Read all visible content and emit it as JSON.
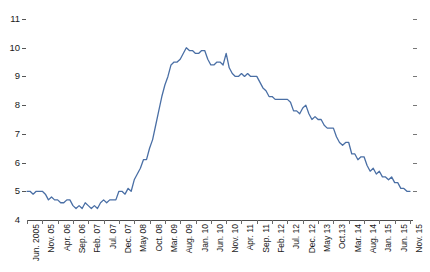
{
  "chart_data": {
    "type": "line",
    "title": "",
    "subtitle": "",
    "xlabel": "",
    "ylabel": "",
    "grid": false,
    "legend": "none",
    "line_color": "#4a6fa5",
    "axis_color": "#4a4a4a",
    "ylim": [
      4,
      11
    ],
    "yticks": [
      4,
      5,
      6,
      7,
      8,
      9,
      10,
      11
    ],
    "ytick_labels": [
      "4",
      "5",
      "6",
      "7",
      "8",
      "9",
      "10",
      "11"
    ],
    "xtick_labels": [
      "Jun. 2005",
      "Nov. 05",
      "Apr. 06",
      "Sep. 06",
      "Feb. 07",
      "Jul. 07",
      "Dec. 07",
      "May 08",
      "Oct. 08",
      "Mar. 09",
      "Aug. 09",
      "Jan. 10",
      "Jun. 10",
      "Nov. 10",
      "Apr. 11",
      "Sep. 11",
      "Feb. 12",
      "Jul. 12",
      "Dec. 12",
      "May 13",
      "Oct.13",
      "Mar. 14",
      "Aug. 14",
      "Jan. 15",
      "Jun. 15",
      "Nov. 15"
    ],
    "xtick_indices": [
      0,
      5,
      10,
      15,
      20,
      25,
      30,
      35,
      40,
      45,
      50,
      55,
      60,
      65,
      70,
      75,
      80,
      85,
      90,
      95,
      100,
      105,
      110,
      115,
      120,
      125
    ],
    "x": [
      "Jun 2005",
      "Jul 2005",
      "Aug 2005",
      "Sep 2005",
      "Oct 2005",
      "Nov 2005",
      "Dec 2005",
      "Jan 2006",
      "Feb 2006",
      "Mar 2006",
      "Apr 2006",
      "May 2006",
      "Jun 2006",
      "Jul 2006",
      "Aug 2006",
      "Sep 2006",
      "Oct 2006",
      "Nov 2006",
      "Dec 2006",
      "Jan 2007",
      "Feb 2007",
      "Mar 2007",
      "Apr 2007",
      "May 2007",
      "Jun 2007",
      "Jul 2007",
      "Aug 2007",
      "Sep 2007",
      "Oct 2007",
      "Nov 2007",
      "Dec 2007",
      "Jan 2008",
      "Feb 2008",
      "Mar 2008",
      "Apr 2008",
      "May 2008",
      "Jun 2008",
      "Jul 2008",
      "Aug 2008",
      "Sep 2008",
      "Oct 2008",
      "Nov 2008",
      "Dec 2008",
      "Jan 2009",
      "Feb 2009",
      "Mar 2009",
      "Apr 2009",
      "May 2009",
      "Jun 2009",
      "Jul 2009",
      "Aug 2009",
      "Sep 2009",
      "Oct 2009",
      "Nov 2009",
      "Dec 2009",
      "Jan 2010",
      "Feb 2010",
      "Mar 2010",
      "Apr 2010",
      "May 2010",
      "Jun 2010",
      "Jul 2010",
      "Aug 2010",
      "Sep 2010",
      "Oct 2010",
      "Nov 2010",
      "Dec 2010",
      "Jan 2011",
      "Feb 2011",
      "Mar 2011",
      "Apr 2011",
      "May 2011",
      "Jun 2011",
      "Jul 2011",
      "Aug 2011",
      "Sep 2011",
      "Oct 2011",
      "Nov 2011",
      "Dec 2011",
      "Jan 2012",
      "Feb 2012",
      "Mar 2012",
      "Apr 2012",
      "May 2012",
      "Jun 2012",
      "Jul 2012",
      "Aug 2012",
      "Sep 2012",
      "Oct 2012",
      "Nov 2012",
      "Dec 2012",
      "Jan 2013",
      "Feb 2013",
      "Mar 2013",
      "Apr 2013",
      "May 2013",
      "Jun 2013",
      "Jul 2013",
      "Aug 2013",
      "Sep 2013",
      "Oct 2013",
      "Nov 2013",
      "Dec 2013",
      "Jan 2014",
      "Feb 2014",
      "Mar 2014",
      "Apr 2014",
      "May 2014",
      "Jun 2014",
      "Jul 2014",
      "Aug 2014",
      "Sep 2014",
      "Oct 2014",
      "Nov 2014",
      "Dec 2014",
      "Jan 2015",
      "Feb 2015",
      "Mar 2015",
      "Apr 2015",
      "May 2015",
      "Jun 2015",
      "Jul 2015",
      "Aug 2015",
      "Sep 2015",
      "Oct 2015",
      "Nov 2015"
    ],
    "values": [
      5.0,
      5.0,
      4.9,
      5.0,
      5.0,
      5.0,
      4.9,
      4.7,
      4.8,
      4.7,
      4.7,
      4.6,
      4.6,
      4.7,
      4.7,
      4.5,
      4.4,
      4.5,
      4.4,
      4.6,
      4.5,
      4.4,
      4.5,
      4.4,
      4.6,
      4.7,
      4.6,
      4.7,
      4.7,
      4.7,
      5.0,
      5.0,
      4.9,
      5.1,
      5.0,
      5.4,
      5.6,
      5.8,
      6.1,
      6.1,
      6.5,
      6.8,
      7.3,
      7.8,
      8.3,
      8.7,
      9.0,
      9.4,
      9.5,
      9.5,
      9.6,
      9.8,
      10.0,
      9.9,
      9.9,
      9.8,
      9.8,
      9.9,
      9.9,
      9.6,
      9.4,
      9.4,
      9.5,
      9.5,
      9.4,
      9.8,
      9.3,
      9.1,
      9.0,
      9.0,
      9.1,
      9.0,
      9.1,
      9.0,
      9.0,
      9.0,
      8.8,
      8.6,
      8.5,
      8.3,
      8.3,
      8.2,
      8.2,
      8.2,
      8.2,
      8.2,
      8.1,
      7.8,
      7.8,
      7.7,
      7.9,
      8.0,
      7.7,
      7.5,
      7.6,
      7.5,
      7.5,
      7.3,
      7.2,
      7.2,
      7.2,
      6.9,
      6.7,
      6.6,
      6.7,
      6.7,
      6.3,
      6.3,
      6.1,
      6.2,
      6.2,
      5.9,
      5.7,
      5.8,
      5.6,
      5.7,
      5.5,
      5.5,
      5.4,
      5.5,
      5.3,
      5.3,
      5.1,
      5.1,
      5.0,
      5.0
    ]
  }
}
